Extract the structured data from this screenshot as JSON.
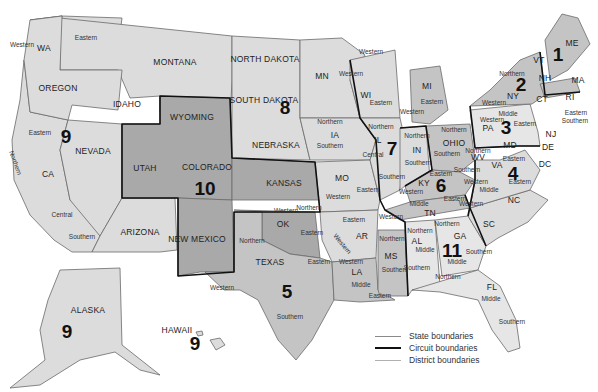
{
  "map": {
    "states": [
      {
        "name": "WA",
        "x": 44,
        "y": 48
      },
      {
        "name": "OREGON",
        "x": 58,
        "y": 88
      },
      {
        "name": "IDAHO",
        "x": 127,
        "y": 104
      },
      {
        "name": "MONTANA",
        "x": 175,
        "y": 62
      },
      {
        "name": "NORTH DAKOTA",
        "x": 265,
        "y": 59
      },
      {
        "name": "SOUTH DAKOTA",
        "x": 264,
        "y": 100
      },
      {
        "name": "WYOMING",
        "x": 192,
        "y": 117
      },
      {
        "name": "NEVADA",
        "x": 93,
        "y": 151
      },
      {
        "name": "CA",
        "x": 48,
        "y": 174
      },
      {
        "name": "UTAH",
        "x": 145,
        "y": 168
      },
      {
        "name": "COLORADO",
        "x": 207,
        "y": 167
      },
      {
        "name": "NEBRASKA",
        "x": 276,
        "y": 145
      },
      {
        "name": "KANSAS",
        "x": 284,
        "y": 183
      },
      {
        "name": "ARIZONA",
        "x": 140,
        "y": 232
      },
      {
        "name": "NEW MEXICO",
        "x": 197,
        "y": 239
      },
      {
        "name": "TEXAS",
        "x": 270,
        "y": 262
      },
      {
        "name": "OK",
        "x": 283,
        "y": 224
      },
      {
        "name": "MN",
        "x": 322,
        "y": 76
      },
      {
        "name": "IA",
        "x": 335,
        "y": 135
      },
      {
        "name": "MO",
        "x": 342,
        "y": 178
      },
      {
        "name": "AR",
        "x": 362,
        "y": 236
      },
      {
        "name": "LA",
        "x": 357,
        "y": 272
      },
      {
        "name": "WI",
        "x": 366,
        "y": 95
      },
      {
        "name": "IL",
        "x": 378,
        "y": 140
      },
      {
        "name": "MI",
        "x": 427,
        "y": 86
      },
      {
        "name": "IN",
        "x": 417,
        "y": 150
      },
      {
        "name": "OHIO",
        "x": 454,
        "y": 143
      },
      {
        "name": "KY",
        "x": 424,
        "y": 183
      },
      {
        "name": "TN",
        "x": 430,
        "y": 213
      },
      {
        "name": "MS",
        "x": 391,
        "y": 256
      },
      {
        "name": "AL",
        "x": 417,
        "y": 241
      },
      {
        "name": "GA",
        "x": 460,
        "y": 236
      },
      {
        "name": "FL",
        "x": 492,
        "y": 287
      },
      {
        "name": "SC",
        "x": 489,
        "y": 224
      },
      {
        "name": "NC",
        "x": 514,
        "y": 200
      },
      {
        "name": "VA",
        "x": 497,
        "y": 165
      },
      {
        "name": "WV",
        "x": 478,
        "y": 157
      },
      {
        "name": "MD",
        "x": 510,
        "y": 145
      },
      {
        "name": "DE",
        "x": 548,
        "y": 147
      },
      {
        "name": "DC",
        "x": 545,
        "y": 164
      },
      {
        "name": "PA",
        "x": 488,
        "y": 128
      },
      {
        "name": "NJ",
        "x": 551,
        "y": 134
      },
      {
        "name": "NY",
        "x": 513,
        "y": 96
      },
      {
        "name": "VT",
        "x": 539,
        "y": 60
      },
      {
        "name": "NH",
        "x": 545,
        "y": 78
      },
      {
        "name": "ME",
        "x": 572,
        "y": 43
      },
      {
        "name": "MA",
        "x": 578,
        "y": 80
      },
      {
        "name": "CT",
        "x": 542,
        "y": 99
      },
      {
        "name": "RI",
        "x": 570,
        "y": 97
      },
      {
        "name": "ALASKA",
        "x": 88,
        "y": 310
      },
      {
        "name": "HAWAII",
        "x": 177,
        "y": 330
      }
    ],
    "districts": [
      {
        "name": "Western",
        "x": 22,
        "y": 45
      },
      {
        "name": "Eastern",
        "x": 86,
        "y": 38
      },
      {
        "name": "Eastern",
        "x": 40,
        "y": 133
      },
      {
        "name": "Northern",
        "x": 15,
        "y": 163,
        "rotate": 70
      },
      {
        "name": "Central",
        "x": 62,
        "y": 215
      },
      {
        "name": "Southern",
        "x": 82,
        "y": 237
      },
      {
        "name": "Northern",
        "x": 252,
        "y": 241
      },
      {
        "name": "Western",
        "x": 222,
        "y": 288
      },
      {
        "name": "Eastern",
        "x": 319,
        "y": 262
      },
      {
        "name": "Southern",
        "x": 290,
        "y": 317
      },
      {
        "name": "Western",
        "x": 286,
        "y": 211
      },
      {
        "name": "Northern",
        "x": 309,
        "y": 208
      },
      {
        "name": "Eastern",
        "x": 312,
        "y": 233
      },
      {
        "name": "Northern",
        "x": 330,
        "y": 122
      },
      {
        "name": "Southern",
        "x": 330,
        "y": 146
      },
      {
        "name": "Western",
        "x": 338,
        "y": 197
      },
      {
        "name": "Eastern",
        "x": 368,
        "y": 190
      },
      {
        "name": "Eastern",
        "x": 354,
        "y": 220
      },
      {
        "name": "Western",
        "x": 342,
        "y": 244,
        "rotate": 50
      },
      {
        "name": "Western",
        "x": 351,
        "y": 262
      },
      {
        "name": "Middle",
        "x": 361,
        "y": 285
      },
      {
        "name": "Eastern",
        "x": 380,
        "y": 296
      },
      {
        "name": "Western",
        "x": 371,
        "y": 52
      },
      {
        "name": "Western",
        "x": 351,
        "y": 74
      },
      {
        "name": "Eastern",
        "x": 381,
        "y": 103
      },
      {
        "name": "Northern",
        "x": 381,
        "y": 127
      },
      {
        "name": "Central",
        "x": 373,
        "y": 155
      },
      {
        "name": "Southern",
        "x": 392,
        "y": 177
      },
      {
        "name": "Eastern",
        "x": 432,
        "y": 102
      },
      {
        "name": "Western",
        "x": 412,
        "y": 112
      },
      {
        "name": "Northern",
        "x": 417,
        "y": 136
      },
      {
        "name": "Southern",
        "x": 418,
        "y": 163
      },
      {
        "name": "Northern",
        "x": 454,
        "y": 130
      },
      {
        "name": "Southern",
        "x": 447,
        "y": 154
      },
      {
        "name": "Eastern",
        "x": 441,
        "y": 174
      },
      {
        "name": "Western",
        "x": 411,
        "y": 192
      },
      {
        "name": "Eastern",
        "x": 455,
        "y": 199
      },
      {
        "name": "Middle",
        "x": 419,
        "y": 204
      },
      {
        "name": "Western",
        "x": 391,
        "y": 217
      },
      {
        "name": "Northern",
        "x": 392,
        "y": 239
      },
      {
        "name": "Southern",
        "x": 395,
        "y": 270
      },
      {
        "name": "Northern",
        "x": 420,
        "y": 231
      },
      {
        "name": "Middle",
        "x": 425,
        "y": 250
      },
      {
        "name": "Southern",
        "x": 417,
        "y": 268
      },
      {
        "name": "Northern",
        "x": 447,
        "y": 224
      },
      {
        "name": "Middle",
        "x": 457,
        "y": 262
      },
      {
        "name": "Southern",
        "x": 479,
        "y": 252
      },
      {
        "name": "Northern",
        "x": 448,
        "y": 277
      },
      {
        "name": "Middle",
        "x": 491,
        "y": 299
      },
      {
        "name": "Southern",
        "x": 512,
        "y": 322
      },
      {
        "name": "Western",
        "x": 471,
        "y": 204
      },
      {
        "name": "Middle",
        "x": 489,
        "y": 190
      },
      {
        "name": "Eastern",
        "x": 520,
        "y": 182
      },
      {
        "name": "Western",
        "x": 476,
        "y": 182
      },
      {
        "name": "Eastern",
        "x": 514,
        "y": 159
      },
      {
        "name": "Northern",
        "x": 478,
        "y": 151
      },
      {
        "name": "Southern",
        "x": 467,
        "y": 170
      },
      {
        "name": "Western",
        "x": 492,
        "y": 120
      },
      {
        "name": "Middle",
        "x": 508,
        "y": 114
      },
      {
        "name": "Eastern",
        "x": 525,
        "y": 124
      },
      {
        "name": "Western",
        "x": 494,
        "y": 103
      },
      {
        "name": "Northern",
        "x": 512,
        "y": 74
      },
      {
        "name": "Eastern",
        "x": 576,
        "y": 113
      },
      {
        "name": "Southern",
        "x": 575,
        "y": 121
      }
    ],
    "circuits": [
      {
        "number": "1",
        "x": 558,
        "y": 54
      },
      {
        "number": "2",
        "x": 521,
        "y": 84
      },
      {
        "number": "3",
        "x": 506,
        "y": 127
      },
      {
        "number": "4",
        "x": 513,
        "y": 173
      },
      {
        "number": "5",
        "x": 287,
        "y": 291
      },
      {
        "number": "6",
        "x": 441,
        "y": 185
      },
      {
        "number": "7",
        "x": 392,
        "y": 148
      },
      {
        "number": "8",
        "x": 285,
        "y": 107
      },
      {
        "number": "9",
        "x": 66,
        "y": 136
      },
      {
        "number": "10",
        "x": 205,
        "y": 188
      },
      {
        "number": "11",
        "x": 452,
        "y": 250
      },
      {
        "number": "9",
        "x": 67,
        "y": 331
      },
      {
        "number": "9",
        "x": 195,
        "y": 343
      }
    ]
  },
  "legend": {
    "items": [
      {
        "label": "State boundaries",
        "style": "state",
        "color": "#8a8a8a"
      },
      {
        "label": "Circuit boundaries",
        "style": "circuit",
        "color": "#111111"
      },
      {
        "label": "District boundaries",
        "style": "district",
        "color": "#9a9a9a"
      }
    ]
  },
  "colors": {
    "background": "#ffffff",
    "light": "#dcdcdc",
    "mid": "#c4c4c4",
    "dark": "#a9a9a9",
    "pale": "#e6e6e6"
  }
}
